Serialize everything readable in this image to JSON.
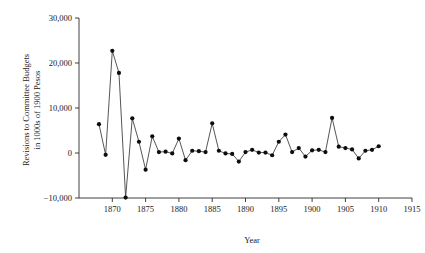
{
  "chart_data": {
    "type": "line",
    "title": "",
    "xlabel": "Year",
    "ylabel": "Revisions to Committee Budgets in 1000s of 1900 Pesos",
    "ylabel_lines": [
      "Revisions to Committee Budgets",
      "in 1000s of 1900 Pesos"
    ],
    "xlim": [
      1865,
      1915
    ],
    "ylim": [
      -10000,
      30000
    ],
    "grid": false,
    "legend": false,
    "marker": "filled-circle",
    "line_color": "#2b2b2b",
    "marker_color": "#0d0d0d",
    "xticks": [
      1870,
      1875,
      1880,
      1885,
      1890,
      1895,
      1900,
      1905,
      1910,
      1915
    ],
    "xtick_labels": [
      "1870",
      "1875",
      "1880",
      "1885",
      "1890",
      "1895",
      "1900",
      "1905",
      "1910",
      "1915"
    ],
    "yticks": [
      -10000,
      0,
      10000,
      20000,
      30000
    ],
    "ytick_labels": [
      "−10,000",
      "0",
      "10,000",
      "20,000",
      "30,000"
    ],
    "x": [
      1868,
      1869,
      1870,
      1871,
      1872,
      1873,
      1874,
      1875,
      1876,
      1877,
      1878,
      1879,
      1880,
      1881,
      1882,
      1883,
      1884,
      1885,
      1886,
      1887,
      1888,
      1889,
      1890,
      1891,
      1892,
      1893,
      1894,
      1895,
      1896,
      1897,
      1898,
      1899,
      1900,
      1901,
      1902,
      1903,
      1904,
      1905,
      1906,
      1907,
      1908,
      1909,
      1910
    ],
    "values": [
      6400,
      -400,
      22700,
      17800,
      -9900,
      7700,
      2500,
      -3700,
      3700,
      200,
      300,
      -100,
      3200,
      -1600,
      500,
      400,
      200,
      6600,
      500,
      -100,
      -200,
      -1900,
      200,
      700,
      100,
      100,
      -500,
      2500,
      4100,
      200,
      1100,
      -800,
      600,
      700,
      200,
      7800,
      1400,
      1100,
      800,
      -1200,
      500,
      700,
      1500
    ],
    "series_name": "Revisions to Committee Budgets"
  }
}
